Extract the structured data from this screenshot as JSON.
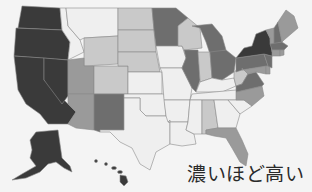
{
  "caption": "濃いほど高い",
  "legend": {
    "meaning": "darker = higher",
    "shades": {
      "level5": "#3a3a3a",
      "level4": "#6e6e6e",
      "level3": "#9a9a9a",
      "level2": "#c9c9c9",
      "level1": "#efefef"
    }
  },
  "map": {
    "type": "choropleth",
    "region": "United States",
    "background": "#f4f4f4",
    "states": [
      {
        "id": "WA",
        "level": 5
      },
      {
        "id": "OR",
        "level": 5
      },
      {
        "id": "CA",
        "level": 5
      },
      {
        "id": "AK",
        "level": 5
      },
      {
        "id": "HI",
        "level": 5
      },
      {
        "id": "NY",
        "level": 5
      },
      {
        "id": "NJ",
        "level": 4
      },
      {
        "id": "MA",
        "level": 4
      },
      {
        "id": "ID",
        "level": 1
      },
      {
        "id": "MT",
        "level": 1
      },
      {
        "id": "NV",
        "level": 5
      },
      {
        "id": "WY",
        "level": 2
      },
      {
        "id": "UT",
        "level": 3
      },
      {
        "id": "CO",
        "level": 2
      },
      {
        "id": "AZ",
        "level": 3
      },
      {
        "id": "NM",
        "level": 4
      },
      {
        "id": "ND",
        "level": 2
      },
      {
        "id": "SD",
        "level": 2
      },
      {
        "id": "NE",
        "level": 2
      },
      {
        "id": "KS",
        "level": 1
      },
      {
        "id": "OK",
        "level": 1
      },
      {
        "id": "TX",
        "level": 1
      },
      {
        "id": "MN",
        "level": 4
      },
      {
        "id": "IA",
        "level": 1
      },
      {
        "id": "MO",
        "level": 1
      },
      {
        "id": "AR",
        "level": 1
      },
      {
        "id": "LA",
        "level": 1
      },
      {
        "id": "WI",
        "level": 2
      },
      {
        "id": "IL",
        "level": 4
      },
      {
        "id": "MI",
        "level": 4
      },
      {
        "id": "IN",
        "level": 2
      },
      {
        "id": "OH",
        "level": 4
      },
      {
        "id": "KY",
        "level": 1
      },
      {
        "id": "TN",
        "level": 1
      },
      {
        "id": "MS",
        "level": 1
      },
      {
        "id": "AL",
        "level": 2
      },
      {
        "id": "GA",
        "level": 1
      },
      {
        "id": "FL",
        "level": 3
      },
      {
        "id": "SC",
        "level": 1
      },
      {
        "id": "NC",
        "level": 3
      },
      {
        "id": "VA",
        "level": 4
      },
      {
        "id": "WV",
        "level": 2
      },
      {
        "id": "PA",
        "level": 4
      },
      {
        "id": "MD",
        "level": 3
      },
      {
        "id": "DE",
        "level": 3
      },
      {
        "id": "CT",
        "level": 3
      },
      {
        "id": "RI",
        "level": 3
      },
      {
        "id": "VT",
        "level": 3
      },
      {
        "id": "NH",
        "level": 4
      },
      {
        "id": "ME",
        "level": 3
      }
    ]
  }
}
